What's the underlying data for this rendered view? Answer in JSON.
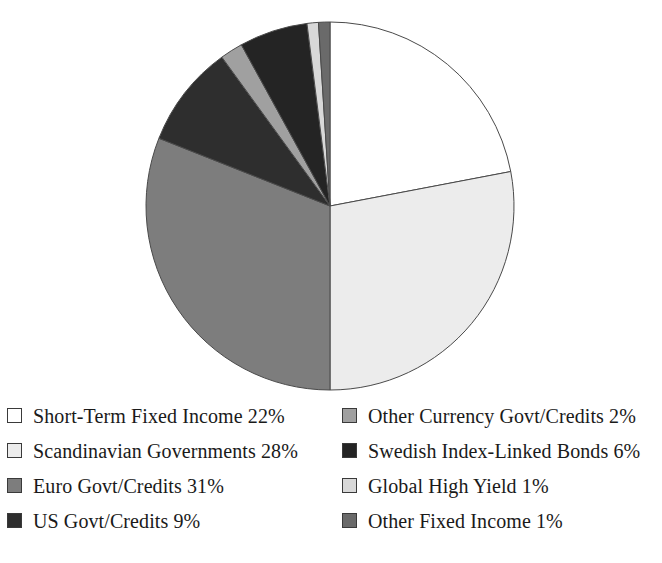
{
  "chart_data": {
    "type": "pie",
    "title": "",
    "subtitle": "",
    "xlabel": "",
    "ylabel": "",
    "legend_position": "bottom",
    "grid": false,
    "start_angle_deg": 0,
    "direction": "clockwise",
    "unit": "%",
    "categories": [
      "Short-Term Fixed Income",
      "Scandinavian Governments",
      "Euro Govt/Credits",
      "US Govt/Credits",
      "Other Currency Govt/Credits",
      "Swedish Index-Linked Bonds",
      "Global High Yield",
      "Other Fixed Income"
    ],
    "values": [
      22,
      28,
      31,
      9,
      2,
      6,
      1,
      1
    ],
    "colors": [
      "#ffffff",
      "#ececec",
      "#7d7d7d",
      "#2e2e2e",
      "#a0a0a0",
      "#242424",
      "#d8d8d8",
      "#6a6a6a"
    ],
    "slice_border_color": "#4a4a4a",
    "slices": [
      {
        "label": "Short-Term Fixed Income",
        "value": 22,
        "display": "Short-Term Fixed Income 22%",
        "color": "#ffffff"
      },
      {
        "label": "Scandinavian Governments",
        "value": 28,
        "display": "Scandinavian Governments 28%",
        "color": "#ececec"
      },
      {
        "label": "Euro Govt/Credits",
        "value": 31,
        "display": "Euro Govt/Credits 31%",
        "color": "#7d7d7d"
      },
      {
        "label": "US Govt/Credits",
        "value": 9,
        "display": "US Govt/Credits 9%",
        "color": "#2e2e2e"
      },
      {
        "label": "Other Currency Govt/Credits",
        "value": 2,
        "display": "Other Currency Govt/Credits 2%",
        "color": "#a0a0a0"
      },
      {
        "label": "Swedish Index-Linked Bonds",
        "value": 6,
        "display": "Swedish Index-Linked Bonds 6%",
        "color": "#242424"
      },
      {
        "label": "Global High Yield",
        "value": 1,
        "display": "Global High Yield 1%",
        "color": "#d8d8d8"
      },
      {
        "label": "Other Fixed Income",
        "value": 1,
        "display": "Other Fixed Income 1%",
        "color": "#6a6a6a"
      }
    ]
  },
  "legend": {
    "left_column": [
      {
        "display": "Short-Term Fixed Income 22%",
        "color": "#ffffff"
      },
      {
        "display": "Scandinavian Governments 28%",
        "color": "#ececec"
      },
      {
        "display": "Euro Govt/Credits 31%",
        "color": "#7d7d7d"
      },
      {
        "display": "US Govt/Credits 9%",
        "color": "#2e2e2e"
      }
    ],
    "right_column": [
      {
        "display": "Other Currency Govt/Credits 2%",
        "color": "#a0a0a0"
      },
      {
        "display": "Swedish Index-Linked Bonds 6%",
        "color": "#242424"
      },
      {
        "display": "Global High Yield 1%",
        "color": "#d8d8d8"
      },
      {
        "display": "Other Fixed Income 1%",
        "color": "#6a6a6a"
      }
    ]
  }
}
